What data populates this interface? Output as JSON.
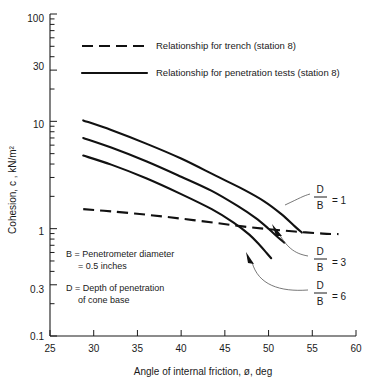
{
  "chart_data": {
    "type": "line",
    "title": "",
    "xlabel": "Angle of internal friction, ø, deg",
    "ylabel": "Cohesion, c , kN/m²",
    "xlim": [
      25,
      60
    ],
    "ylim": [
      0.1,
      100
    ],
    "yscale": "log",
    "xscale": "linear",
    "grid": false,
    "xticks": [
      25,
      30,
      35,
      40,
      45,
      50,
      55,
      60
    ],
    "xtick_labels": [
      "25",
      "30",
      "35",
      "40",
      "45",
      "50",
      "55",
      "60"
    ],
    "yticks": [
      0.1,
      0.3,
      1,
      10,
      30,
      100
    ],
    "ytick_labels": [
      "0.1",
      "0.3",
      "1",
      "10",
      "30",
      "100"
    ],
    "legend_position": "upper-left-inside",
    "series": [
      {
        "name": "Relationship for trench (station 8)",
        "style": "dashed",
        "label": "",
        "x": [
          28.8,
          32,
          36,
          40,
          44,
          47,
          50,
          53,
          56.2,
          58
        ],
        "y": [
          1.52,
          1.45,
          1.35,
          1.24,
          1.13,
          1.05,
          0.99,
          0.94,
          0.9,
          0.89
        ]
      },
      {
        "name": "Relationship for penetration tests (station 8), D/B = 1",
        "style": "solid",
        "label": "D/B = 1",
        "x": [
          28.8,
          32,
          36,
          40,
          44,
          47,
          49.5,
          51.5,
          53,
          53.8
        ],
        "y": [
          10.2,
          8.3,
          6.2,
          4.5,
          3.1,
          2.35,
          1.8,
          1.36,
          1.05,
          0.92
        ]
      },
      {
        "name": "Relationship for penetration tests (station 8), D/B = 3",
        "style": "solid",
        "label": "D/B = 3",
        "x": [
          28.8,
          32,
          36,
          40,
          43.5,
          46.5,
          48.5,
          50,
          51,
          51.8
        ],
        "y": [
          7.0,
          5.7,
          4.25,
          3.05,
          2.25,
          1.62,
          1.26,
          1.0,
          0.84,
          0.74
        ]
      },
      {
        "name": "Relationship for penetration tests (station 8), D/B = 6",
        "style": "solid",
        "label": "D/B = 6",
        "x": [
          28.8,
          32,
          36,
          40,
          43.5,
          46,
          47.8,
          49,
          49.8,
          50.3
        ],
        "y": [
          4.8,
          3.95,
          2.95,
          2.1,
          1.52,
          1.14,
          0.88,
          0.7,
          0.59,
          0.53
        ]
      }
    ],
    "annotations": [
      {
        "id": "db1",
        "text_num": "D",
        "text_den": "B",
        "text_eq": "= 1",
        "x": 55.2,
        "y": 1.95
      },
      {
        "id": "db3",
        "text_num": "D",
        "text_den": "B",
        "text_eq": "= 3",
        "x": 55.2,
        "y": 0.62
      },
      {
        "id": "db6",
        "text_num": "D",
        "text_den": "B",
        "text_eq": "= 6",
        "x": 55.2,
        "y": 0.315
      }
    ],
    "notes": [
      "B = Penetrometer diameter",
      "= 0.5 inches",
      "D = Depth of penetration",
      "of cone base"
    ]
  },
  "legend": {
    "items": [
      {
        "label": "Relationship for trench (station 8)",
        "style": "dashed"
      },
      {
        "label": "Relationship for penetration tests (station 8)",
        "style": "solid"
      }
    ]
  },
  "axes": {
    "x_title": "Angle of internal friction, ø, deg",
    "y_title": "Cohesion, c , kN/m²",
    "x_tick_labels": [
      "25",
      "30",
      "35",
      "40",
      "45",
      "50",
      "55",
      "60"
    ],
    "y_tick_labels": [
      "100",
      "30",
      "10",
      "1",
      "0.3",
      "0.1"
    ]
  },
  "notes": {
    "line1": "B = Penetrometer  diameter",
    "line2": "= 0.5 inches",
    "line3": "D = Depth of penetration",
    "line4": "of cone base"
  },
  "annotations": {
    "db1": {
      "num": "D",
      "den": "B",
      "eq": "= 1"
    },
    "db3": {
      "num": "D",
      "den": "B",
      "eq": "= 3"
    },
    "db6": {
      "num": "D",
      "den": "B",
      "eq": "= 6"
    }
  },
  "colors": {
    "ink": "#1a1a1a",
    "curve": "#111111",
    "leader": "#555555",
    "background": "#ffffff"
  }
}
